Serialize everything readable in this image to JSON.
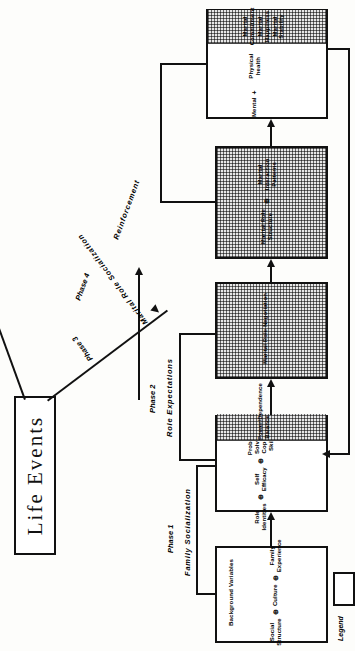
{
  "diagram": {
    "title": "Life Events",
    "legend_label": "Legend",
    "phases": [
      {
        "phase_label": "Phase 1",
        "process_label": "Family Socialization"
      },
      {
        "phase_label": "Phase 2",
        "process_label": "Role Expectations"
      },
      {
        "phase_label": "Phase 3",
        "process_label": "Marital Role Socialization"
      },
      {
        "phase_label": "Phase 4",
        "process_label": "Reinforcement"
      }
    ],
    "boxes": [
      {
        "id": "background",
        "title": "Background Variables",
        "items": [
          "Social Structure",
          "Culture",
          "Family Experience"
        ],
        "shaded_items": [],
        "operator": "⊕"
      },
      {
        "id": "individual",
        "title": "",
        "items": [
          "Role Identities",
          "Self Efficacy",
          "Problem Solving Coping Skills"
        ],
        "shaded_items": [
          "Power/Dependence Balance"
        ],
        "operator": "⊕"
      },
      {
        "id": "negotiation",
        "title": "",
        "items": [],
        "shaded_items": [
          "Marital Role Negotiation"
        ],
        "operator": ""
      },
      {
        "id": "structure",
        "title": "",
        "items": [],
        "shaded_items": [
          "Marital Role Structure",
          "Marital Interaction Patterns"
        ],
        "operator": "⊕"
      },
      {
        "id": "outcome",
        "title": "",
        "items": [
          "Mental",
          "Physical health"
        ],
        "shaded_items": [
          "Marital Commitment",
          "Marital Happiness",
          "Marital Stability"
        ],
        "operator": "+"
      }
    ]
  }
}
